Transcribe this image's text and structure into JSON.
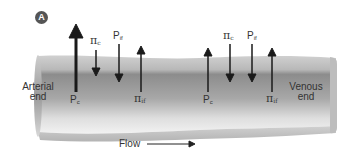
{
  "figure": {
    "panel_label": "A",
    "flow_label": "Flow",
    "ends": {
      "arterial": [
        "Arterial",
        "end"
      ],
      "venous": [
        "Venous",
        "end"
      ]
    }
  },
  "forces": {
    "arterial": [
      {
        "symbol": "P",
        "sub": "c",
        "direction": "up",
        "label_pos": "below",
        "magnitude": "large"
      },
      {
        "symbol": "π",
        "sub": "c",
        "direction": "down",
        "label_pos": "above",
        "magnitude": "small"
      },
      {
        "symbol": "P",
        "sub": "if",
        "direction": "down",
        "label_pos": "above",
        "magnitude": "medium"
      },
      {
        "symbol": "π",
        "sub": "if",
        "direction": "up",
        "label_pos": "below",
        "magnitude": "medium"
      }
    ],
    "venous": [
      {
        "symbol": "P",
        "sub": "c",
        "direction": "up",
        "label_pos": "below",
        "magnitude": "medium"
      },
      {
        "symbol": "π",
        "sub": "c",
        "direction": "down",
        "label_pos": "above",
        "magnitude": "medium"
      },
      {
        "symbol": "P",
        "sub": "if",
        "direction": "down",
        "label_pos": "above",
        "magnitude": "medium"
      },
      {
        "symbol": "π",
        "sub": "if",
        "direction": "up",
        "label_pos": "below",
        "magnitude": "medium"
      }
    ]
  },
  "colors": {
    "vessel_top": "#c4c4c4",
    "vessel_mid": "#8a8a8a",
    "vessel_bottom": "#e6e6e6",
    "arrow": "#1a1a1a",
    "badge": "#555555"
  },
  "labels": {
    "a_pc": {
      "sym": "P",
      "sub": "c"
    },
    "a_pic": {
      "sym": "π",
      "sub": "c"
    },
    "a_pif": {
      "sym": "P",
      "sub": "if"
    },
    "a_piif": {
      "sym": "π",
      "sub": "if"
    },
    "v_pc": {
      "sym": "P",
      "sub": "c"
    },
    "v_pic": {
      "sym": "π",
      "sub": "c"
    },
    "v_pif": {
      "sym": "P",
      "sub": "if"
    },
    "v_piif": {
      "sym": "π",
      "sub": "if"
    }
  }
}
